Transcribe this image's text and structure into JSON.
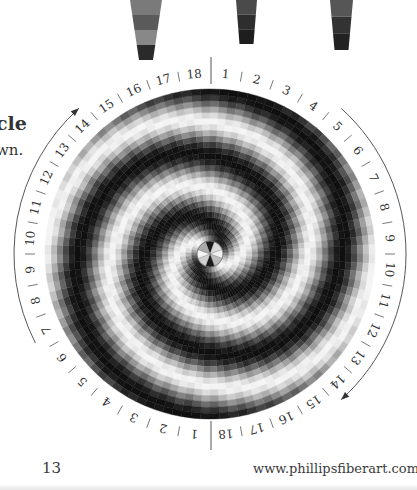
{
  "page": {
    "left_heading_fragment": "cle",
    "left_body_fragment": "wn.",
    "page_number": "13",
    "website": "www.phillipsfiberart.com"
  },
  "yarn_pieces": [
    {
      "x": 130,
      "w_top": 32,
      "w_bottom": 14,
      "h": 60,
      "shades": [
        "#7a7a7a",
        "#5a5a5a",
        "#888888",
        "#2a2a2a"
      ]
    },
    {
      "x": 236,
      "w_top": 21,
      "w_bottom": 14,
      "h": 44,
      "shades": [
        "#4a4a4a",
        "#2e2e2e",
        "#1e1e1e"
      ]
    },
    {
      "x": 330,
      "w_top": 23,
      "w_bottom": 14,
      "h": 50,
      "shades": [
        "#565656",
        "#333333",
        "#222222"
      ]
    }
  ],
  "circle": {
    "cx": 210,
    "cy": 254,
    "radius": 165,
    "center_radius": 13,
    "sectors_per_half": 18,
    "rings": 26,
    "arms": 2,
    "twist": 2.6
  },
  "ring_labels": {
    "top_half": [
      "1",
      "2",
      "3",
      "4",
      "5",
      "6",
      "7",
      "8",
      "9",
      "10",
      "11",
      "12",
      "13",
      "14",
      "15",
      "16",
      "17",
      "18"
    ],
    "bottom_half": [
      "1",
      "2",
      "3",
      "4",
      "5",
      "6",
      "7",
      "8",
      "9",
      "10",
      "11",
      "12",
      "13",
      "14",
      "15",
      "16",
      "17",
      "18"
    ],
    "label_radius": 180
  },
  "direction_arrows": [
    {
      "name": "left-arc-arrow",
      "from_deg": 233,
      "to_deg": 325,
      "radius": 196,
      "arrow_at": "end"
    },
    {
      "name": "right-arc-arrow",
      "from_deg": 40,
      "to_deg": 140,
      "radius": 196,
      "arrow_at": "end"
    }
  ],
  "colors": {
    "dark": "#0a0a0a",
    "light": "#f2f2f2",
    "line": "#555555"
  }
}
